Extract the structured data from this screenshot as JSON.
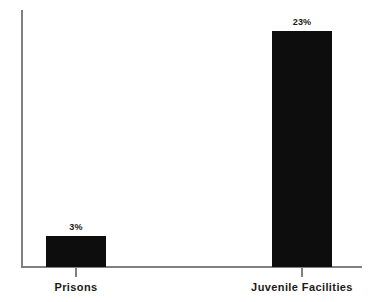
{
  "chart_data": {
    "type": "bar",
    "title": "",
    "xlabel": "",
    "ylabel": "",
    "categories": [
      "Prisons",
      "Juvenile Facilities"
    ],
    "values": [
      3,
      23
    ],
    "value_labels": [
      "3%",
      "23%"
    ],
    "ylim": [
      0,
      25
    ],
    "grid": false,
    "legend": null,
    "bar_color": "#0d0d0d",
    "axis_color": "#808080",
    "background_color": "#ffffff"
  },
  "axes": {
    "y_axis_name": "y-axis-line",
    "x_axis_name": "x-axis-line"
  }
}
